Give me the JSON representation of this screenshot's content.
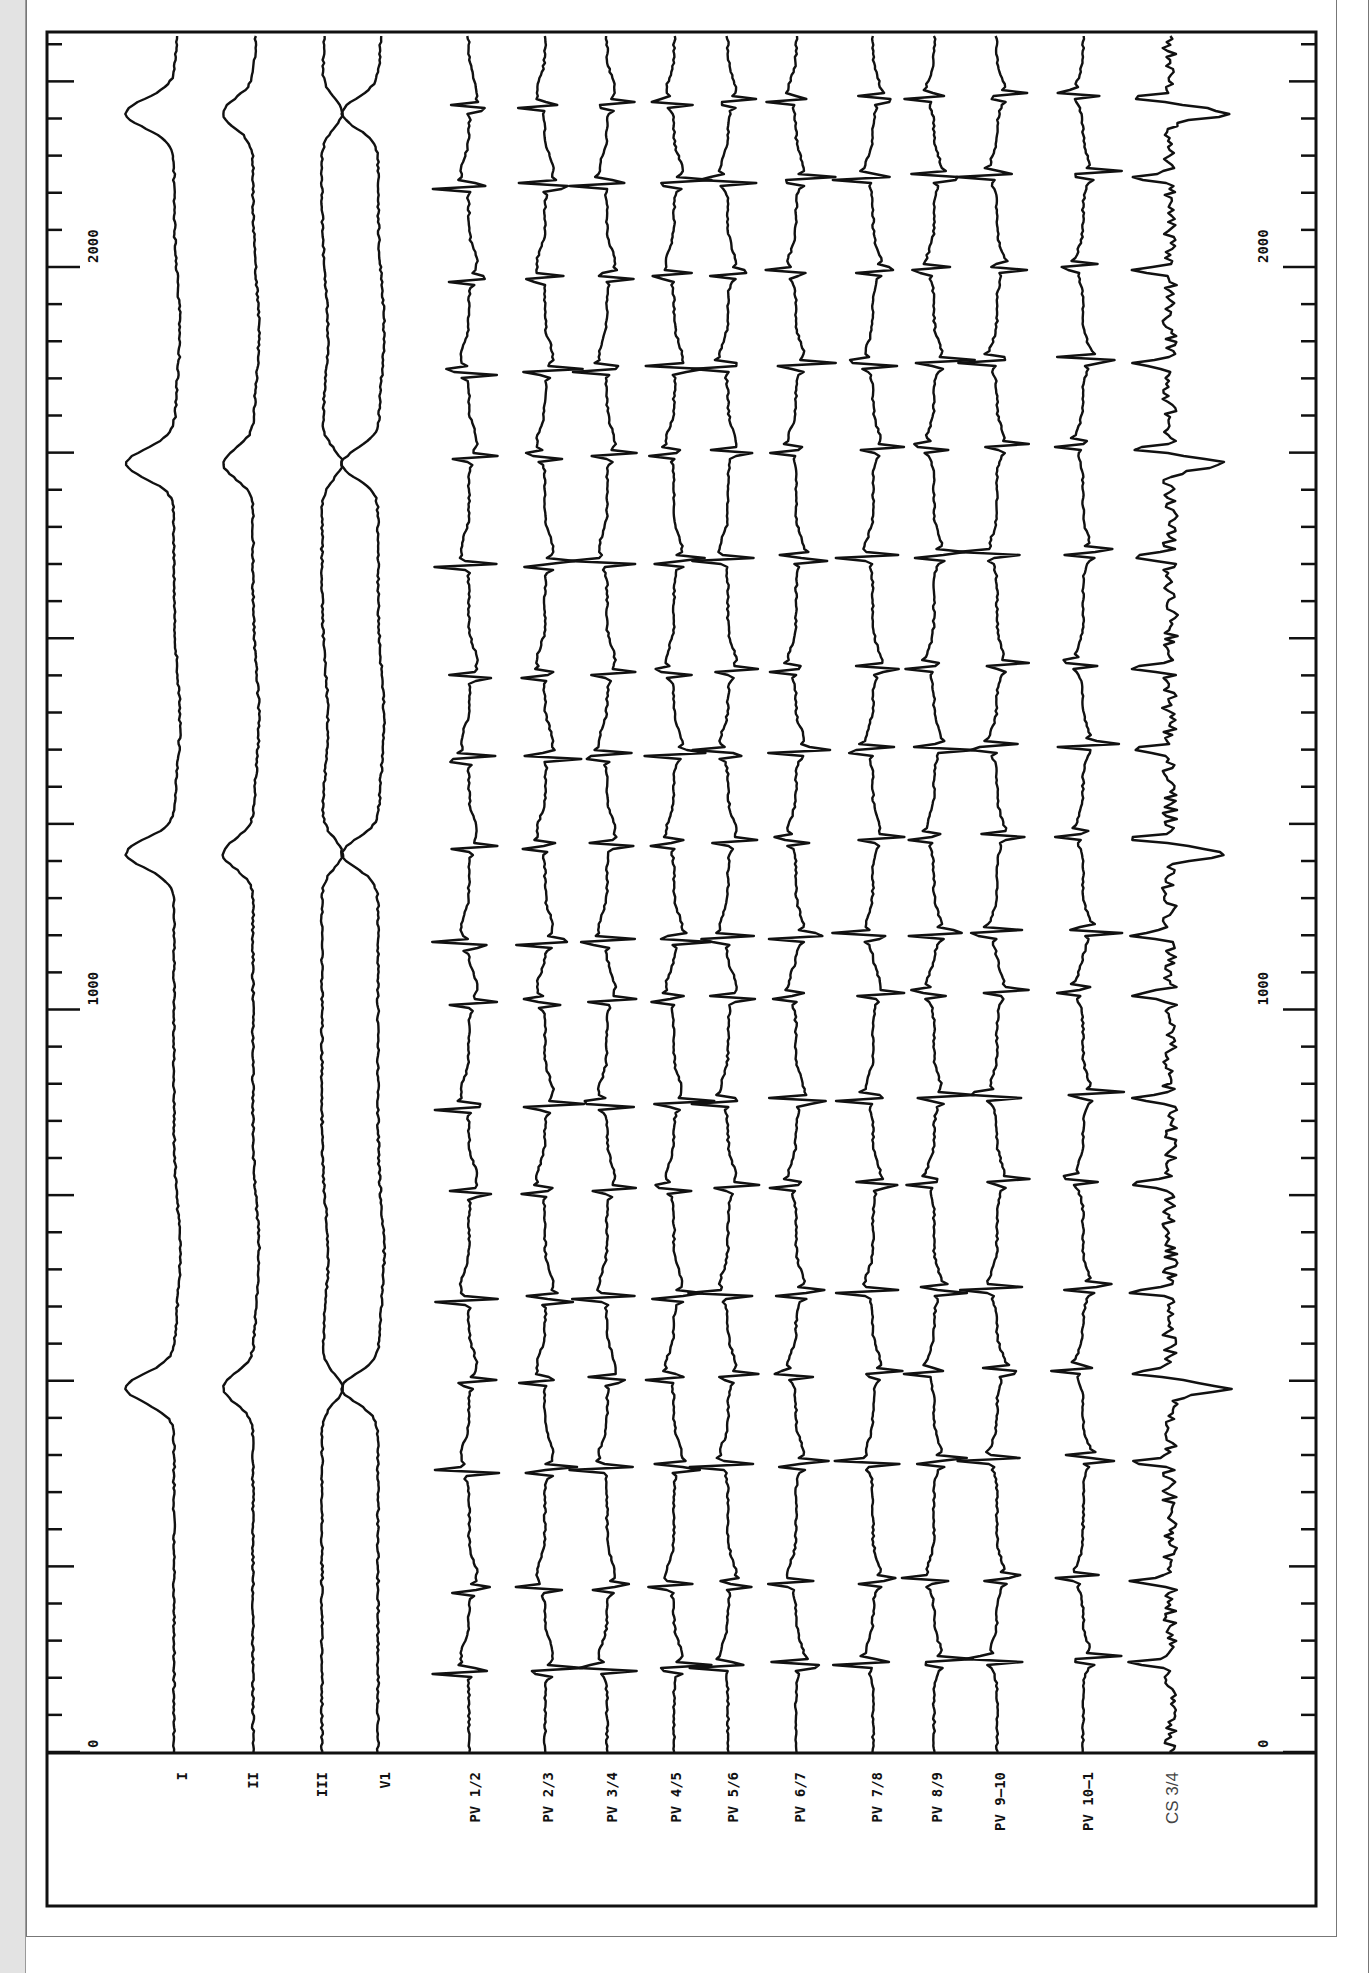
{
  "chart_data": {
    "type": "line",
    "title": "",
    "orientation": "rotated 90° (time runs bottom-to-top)",
    "xlabel": "time (ms)",
    "ylabel": "",
    "xlim": [
      0,
      2300
    ],
    "axis_ticks": [
      "0",
      "1000",
      "2000"
    ],
    "minor_tick_interval_ms": 50,
    "major_tick_interval_ms": 250,
    "grid": false,
    "legend": "none — channel labels under each trace",
    "series": [
      {
        "name": "I",
        "kind": "surface"
      },
      {
        "name": "II",
        "kind": "surface"
      },
      {
        "name": "III",
        "kind": "surface"
      },
      {
        "name": "V1",
        "kind": "surface"
      },
      {
        "name": "PV 1/2",
        "kind": "intracardiac"
      },
      {
        "name": "PV 2/3",
        "kind": "intracardiac"
      },
      {
        "name": "PV 3/4",
        "kind": "intracardiac"
      },
      {
        "name": "PV 4/5",
        "kind": "intracardiac"
      },
      {
        "name": "PV 5/6",
        "kind": "intracardiac"
      },
      {
        "name": "PV 6/7",
        "kind": "intracardiac"
      },
      {
        "name": "PV 7/8",
        "kind": "intracardiac"
      },
      {
        "name": "PV 8/9",
        "kind": "intracardiac"
      },
      {
        "name": "PV 9-10",
        "kind": "intracardiac"
      },
      {
        "name": "PV 10-1",
        "kind": "intracardiac"
      },
      {
        "name": "CS 3/4",
        "kind": "intracardiac"
      }
    ],
    "qrs_times_ms": [
      490,
      1210,
      1735,
      2207
    ],
    "pv_activation_times_ms": [
      100,
      210,
      370,
      490,
      600,
      745,
      860,
      1000,
      1080,
      1210,
      1330,
      1440,
      1590,
      1735,
      1850,
      1975,
      2100,
      2207,
      2320
    ]
  },
  "labels": {
    "channels": [
      "I",
      "II",
      "III",
      "V1",
      "PV 1/2",
      "PV 2/3",
      "PV 3/4",
      "PV 4/5",
      "PV 5/6",
      "PV 6/7",
      "PV 7/8",
      "PV 8/9",
      "PV 9–10",
      "PV 10–1",
      "CS 3/4"
    ],
    "tick_left": [
      "0",
      "1000",
      "2000"
    ],
    "tick_right": [
      "0",
      "1000",
      "2000"
    ]
  }
}
